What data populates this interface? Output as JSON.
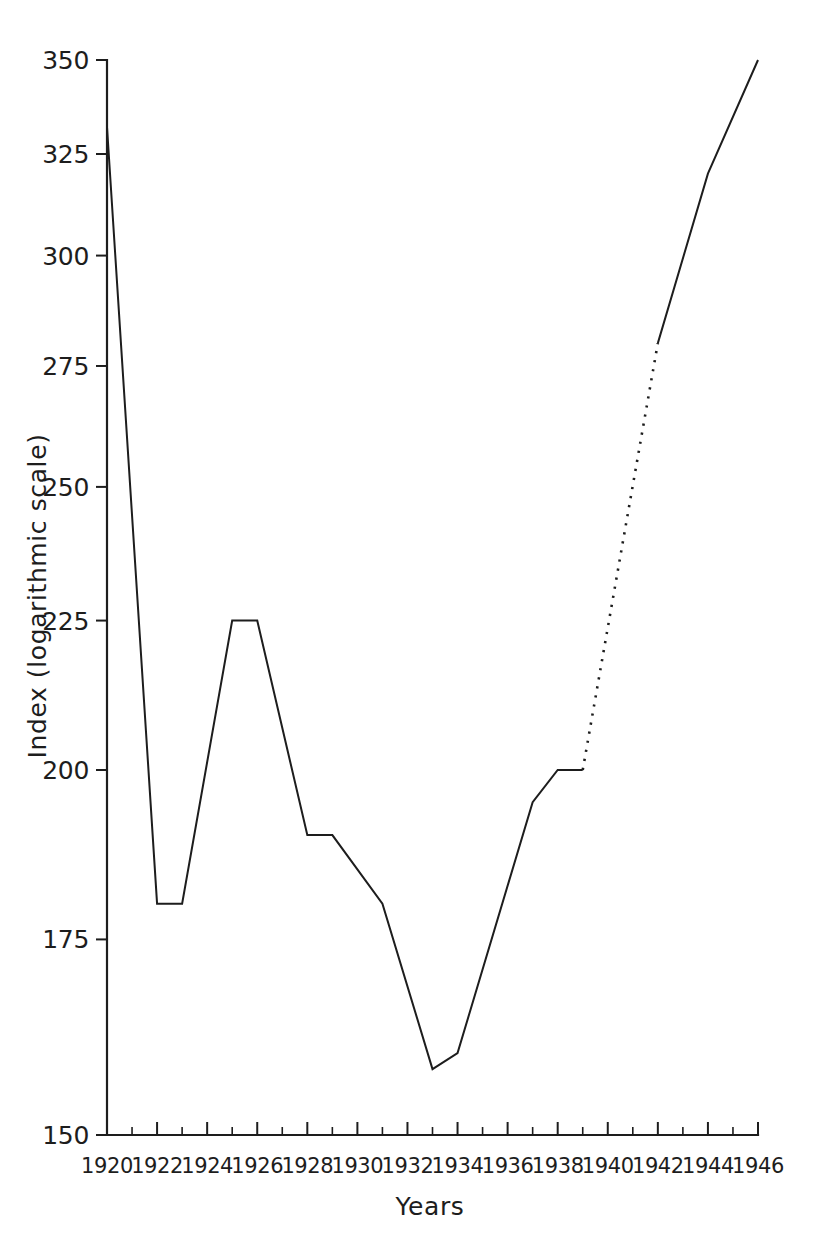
{
  "chart_data": {
    "type": "line",
    "title": "",
    "subtitle": "",
    "xlabel": "Years",
    "ylabel": "Index (logarithmic scale)",
    "yscale": "log",
    "xscale": "linear",
    "xlim": [
      1920,
      1946
    ],
    "ylim": [
      150,
      350
    ],
    "grid": false,
    "legend": null,
    "y_ticks": [
      150,
      175,
      200,
      225,
      250,
      275,
      300,
      325,
      350
    ],
    "y_tick_labels": [
      "150",
      "175",
      "200",
      "225",
      "250",
      "275",
      "300",
      "325",
      "350"
    ],
    "x_ticks_major": [
      1920,
      1922,
      1924,
      1926,
      1928,
      1930,
      1932,
      1934,
      1936,
      1938,
      1940,
      1942,
      1944,
      1946
    ],
    "x_tick_labels": [
      "1920",
      "1922",
      "1924",
      "1926",
      "1928",
      "1930",
      "1932",
      "1934",
      "1936",
      "1938",
      "1940",
      "1942",
      "1944",
      "1946"
    ],
    "x_ticks_minor": [
      1921,
      1923,
      1925,
      1927,
      1929,
      1931,
      1933,
      1935,
      1937,
      1939,
      1941,
      1943,
      1945
    ],
    "line_color": "#1d1d1d",
    "series": [
      {
        "name": "Index",
        "style": "solid",
        "x": [
          1920,
          1922,
          1923,
          1925,
          1926,
          1928,
          1929,
          1931,
          1933,
          1934,
          1937,
          1938,
          1939
        ],
        "values": [
          332,
          180,
          180,
          225,
          225,
          190,
          190,
          180,
          158,
          160,
          195,
          200,
          200
        ]
      },
      {
        "name": "Index (estimated)",
        "style": "dotted",
        "x": [
          1939,
          1942
        ],
        "values": [
          200,
          280
        ]
      },
      {
        "name": "Index (post-war)",
        "style": "solid",
        "x": [
          1942,
          1944,
          1946
        ],
        "values": [
          280,
          320,
          350
        ]
      }
    ]
  }
}
